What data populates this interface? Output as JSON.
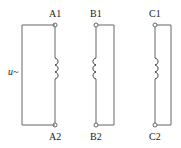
{
  "diagram": {
    "type": "three-phase windings circuit",
    "source_label": "u~",
    "windings": [
      {
        "name": "A",
        "top": "A1",
        "bottom": "A2"
      },
      {
        "name": "B",
        "top": "B1",
        "bottom": "B2"
      },
      {
        "name": "C",
        "top": "C1",
        "bottom": "C2"
      }
    ],
    "line_color": "#555555"
  }
}
